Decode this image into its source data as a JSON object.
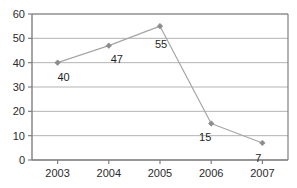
{
  "chart_data": {
    "type": "line",
    "title": "",
    "xlabel": "",
    "ylabel": "",
    "categories": [
      "2003",
      "2004",
      "2005",
      "2006",
      "2007"
    ],
    "values": [
      40,
      47,
      55,
      15,
      7
    ],
    "series": [
      {
        "name": "",
        "values": [
          40,
          47,
          55,
          15,
          7
        ]
      }
    ],
    "data_labels": [
      "40",
      "47",
      "55",
      "15",
      "7"
    ],
    "ylim": [
      0,
      60
    ],
    "yticks": [
      0,
      10,
      20,
      30,
      40,
      50,
      60
    ],
    "ytick_labels": [
      "0",
      "10",
      "20",
      "30",
      "40",
      "50",
      "60"
    ],
    "xtick_labels": [
      "2003",
      "2004",
      "2005",
      "2006",
      "2007"
    ],
    "grid": "horizontal",
    "legend": "none",
    "colors": {
      "line": "#a6a6a6",
      "marker": "#8c8c8c",
      "gridline": "#b3b3b3",
      "axis": "#7f7f7f",
      "text": "#2b2b2b",
      "background": "#ffffff"
    }
  }
}
